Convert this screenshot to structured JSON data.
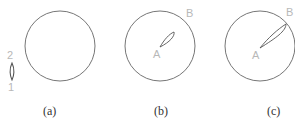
{
  "colors": {
    "circle_stroke": "#666666",
    "lobe_stroke": "#555555",
    "label_color": "#b8b8b8",
    "caption_color": "#333333"
  },
  "panels": [
    {
      "caption": "(a)",
      "circle": {
        "cx": 60,
        "cy": 46,
        "r": 35
      },
      "legend_lobe": {
        "top_label": "2",
        "bottom_label": "1"
      }
    },
    {
      "caption": "(b)",
      "circle": {
        "cx": 160,
        "cy": 46,
        "r": 35
      },
      "point_a_label": "A",
      "point_b_label": "B"
    },
    {
      "caption": "(c)",
      "circle": {
        "cx": 260,
        "cy": 46,
        "r": 35
      },
      "point_a_label": "A",
      "point_b_label": "B"
    }
  ]
}
